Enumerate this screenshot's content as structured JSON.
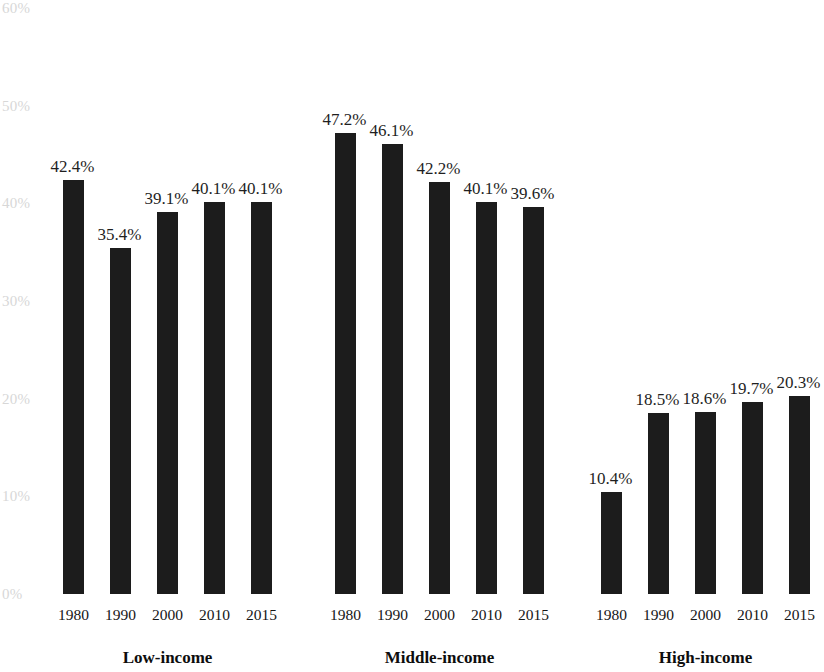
{
  "chart_data": {
    "type": "bar",
    "title": "",
    "subtitle": "",
    "xlabel": "",
    "ylabel": "",
    "categories": [
      "1980",
      "1990",
      "2000",
      "2010",
      "2015"
    ],
    "groups": [
      {
        "name": "Low-income",
        "values": [
          42.4,
          35.4,
          39.1,
          40.1,
          40.1
        ],
        "value_labels": [
          "42.4%",
          "35.4%",
          "39.1%",
          "40.1%",
          "40.1%"
        ]
      },
      {
        "name": "Middle-income",
        "values": [
          47.2,
          46.1,
          42.2,
          40.1,
          39.6
        ],
        "value_labels": [
          "47.2%",
          "46.1%",
          "42.2%",
          "40.1%",
          "39.6%"
        ]
      },
      {
        "name": "High-income",
        "values": [
          10.4,
          18.5,
          18.6,
          19.7,
          20.3
        ],
        "value_labels": [
          "10.4%",
          "18.5%",
          "18.6%",
          "19.7%",
          "20.3%"
        ]
      }
    ],
    "ylim": [
      0,
      60
    ],
    "y_ticks": [
      0,
      10,
      20,
      30,
      40,
      50,
      60
    ],
    "y_tick_labels": [
      "0%",
      "10%",
      "20%",
      "30%",
      "40%",
      "50%",
      "60%"
    ],
    "grid": false,
    "legend": "none",
    "bar_color": "#1c1c1c",
    "axis_label_color": "#d7d7d7",
    "value_label_color": "#1f1f1f"
  },
  "axis": {
    "y_labels": [
      {
        "text": "60%",
        "value": 60
      },
      {
        "text": "50%",
        "value": 50
      },
      {
        "text": "40%",
        "value": 40
      },
      {
        "text": "30%",
        "value": 30
      },
      {
        "text": "20%",
        "value": 20
      },
      {
        "text": "10%",
        "value": 10
      },
      {
        "text": "0%",
        "value": 0
      }
    ]
  },
  "groups": [
    {
      "label": "Low-income",
      "bars": [
        {
          "year": "1980",
          "label": "42.4%"
        },
        {
          "year": "1990",
          "label": "35.4%"
        },
        {
          "year": "2000",
          "label": "39.1%"
        },
        {
          "year": "2010",
          "label": "40.1%"
        },
        {
          "year": "2015",
          "label": "40.1%"
        }
      ]
    },
    {
      "label": "Middle-income",
      "bars": [
        {
          "year": "1980",
          "label": "47.2%"
        },
        {
          "year": "1990",
          "label": "46.1%"
        },
        {
          "year": "2000",
          "label": "42.2%"
        },
        {
          "year": "2010",
          "label": "40.1%"
        },
        {
          "year": "2015",
          "label": "39.6%"
        }
      ]
    },
    {
      "label": "High-income",
      "bars": [
        {
          "year": "1980",
          "label": "10.4%"
        },
        {
          "year": "1990",
          "label": "18.5%"
        },
        {
          "year": "2000",
          "label": "18.6%"
        },
        {
          "year": "2010",
          "label": "19.7%"
        },
        {
          "year": "2015",
          "label": "20.3%"
        }
      ]
    }
  ]
}
